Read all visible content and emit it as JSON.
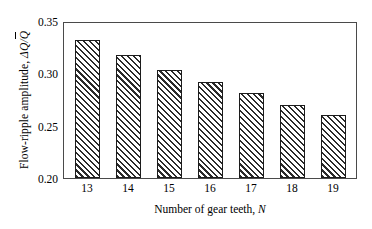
{
  "chart_data": {
    "type": "bar",
    "title": "",
    "subtitle": "",
    "xlabel_text": "Number of gear teeth, ",
    "xlabel_symbol": "N",
    "ylabel_text": "Flow-ripple amplitude, ",
    "ylabel_delta": "ΔQ",
    "ylabel_slash": "/",
    "ylabel_qbar": "Q",
    "categories": [
      "13",
      "14",
      "15",
      "16",
      "17",
      "18",
      "19"
    ],
    "values": [
      0.334,
      0.319,
      0.305,
      0.293,
      0.282,
      0.271,
      0.261
    ],
    "series": [
      {
        "name": "Flow-ripple amplitude",
        "values": [
          0.334,
          0.319,
          0.305,
          0.293,
          0.282,
          0.271,
          0.261
        ]
      }
    ],
    "ylim": [
      0.2,
      0.35
    ],
    "yticks": [
      "0.20",
      "0.25",
      "0.30",
      "0.35"
    ],
    "ytick_values": [
      0.2,
      0.25,
      0.3,
      0.35
    ],
    "xlim_note": "categorical",
    "grid": false,
    "legend": false,
    "legend_position": "none",
    "bar_fill": "hatched-diagonal",
    "bar_edge_color": "#1c1c1c",
    "axis_color": "#4a4a4a",
    "background": "#ffffff"
  }
}
